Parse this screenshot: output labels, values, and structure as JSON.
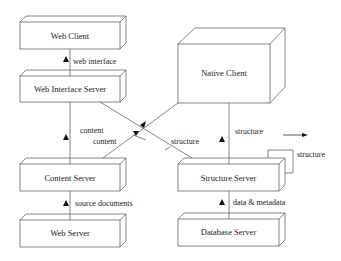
{
  "diagram": {
    "nodes": [
      {
        "id": "web_client",
        "label": "Web Client"
      },
      {
        "id": "web_interface_server",
        "label": "Web Interface Server"
      },
      {
        "id": "content_server",
        "label": "Content Server"
      },
      {
        "id": "web_server",
        "label": "Web Server"
      },
      {
        "id": "native_client",
        "label": "Native Client"
      },
      {
        "id": "structure_server",
        "label": "Structure Server"
      },
      {
        "id": "database_server",
        "label": "Database Server"
      }
    ],
    "edges": [
      {
        "from": "web_interface_server",
        "to": "web_client",
        "label": "web interface"
      },
      {
        "from": "content_server",
        "to": "web_interface_server",
        "label": "content"
      },
      {
        "from": "content_server",
        "to": "native_client",
        "label": "content"
      },
      {
        "from": "structure_server",
        "to": "web_interface_server",
        "label": "structure"
      },
      {
        "from": "structure_server",
        "to": "native_client",
        "label": "structure"
      },
      {
        "from": "structure_server",
        "to": "structure_server",
        "label": "structure"
      },
      {
        "from": "web_server",
        "to": "content_server",
        "label": "source documents"
      },
      {
        "from": "database_server",
        "to": "structure_server",
        "label": "data & metadata"
      }
    ]
  },
  "colors": {
    "line": "#555555",
    "text": "#222222",
    "background": "#ffffff"
  }
}
